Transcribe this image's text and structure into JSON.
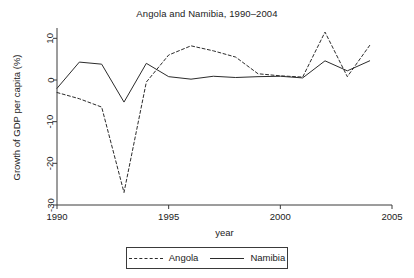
{
  "chart_data": {
    "type": "line",
    "title": "Angola and Namibia, 1990–2004",
    "xlabel": "year",
    "ylabel": "Growth of GDP per capita (%)",
    "x": [
      1990,
      1991,
      1992,
      1993,
      1994,
      1995,
      1996,
      1997,
      1998,
      1999,
      2000,
      2001,
      2002,
      2003,
      2004
    ],
    "xlim": [
      1990,
      2005
    ],
    "ylim": [
      -30,
      12
    ],
    "xticks": [
      1990,
      1995,
      2000,
      2005
    ],
    "xtick_labels": [
      "1990",
      "1995",
      "2000",
      "2005"
    ],
    "yticks": [
      10,
      0,
      -10,
      -20,
      -30
    ],
    "ytick_labels": [
      "10",
      "0",
      "-10",
      "-20",
      "-30"
    ],
    "grid": false,
    "legend_position": "below-center",
    "series": [
      {
        "name": "Angola",
        "style": "dashed",
        "color": "#2b2b2b",
        "values": [
          -3.0,
          -4.5,
          -6.5,
          -27.0,
          -0.5,
          6.0,
          8.2,
          7.0,
          5.5,
          1.5,
          1.0,
          0.7,
          11.5,
          0.8,
          8.3
        ]
      },
      {
        "name": "Namibia",
        "style": "solid",
        "color": "#2b2b2b",
        "values": [
          -2.0,
          4.3,
          3.8,
          -5.3,
          4.0,
          0.8,
          0.2,
          0.9,
          0.6,
          0.8,
          0.9,
          0.5,
          4.6,
          2.2,
          4.6
        ]
      }
    ]
  },
  "legend": {
    "items": [
      {
        "label": "Angola",
        "style": "dashed"
      },
      {
        "label": "Namibia",
        "style": "solid"
      }
    ]
  }
}
